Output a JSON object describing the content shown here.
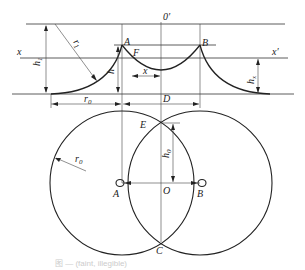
{
  "diagram": {
    "type": "geometric construction (bubble/sphere profile with two intersecting circles)",
    "labels": {
      "o_prime": "0′",
      "A_top": "A",
      "B_top": "B",
      "F": "F",
      "x_left": "x",
      "x_right": "x′",
      "x_dim": "x",
      "h1": "h",
      "h1_sub": "1",
      "r1": "r",
      "r1_sub": "1",
      "h": "h",
      "hx": "h",
      "hx_sub": "x",
      "r0_dim": "r",
      "r0_sub": "0",
      "D": "D",
      "E": "E",
      "h0": "h",
      "h0_sub": "0",
      "r0_circle": "r",
      "r0c_sub": "0",
      "A_bottom": "A",
      "O": "O",
      "B_bottom": "B",
      "C": "C"
    },
    "caption": "图 — (faint, illegible)"
  }
}
